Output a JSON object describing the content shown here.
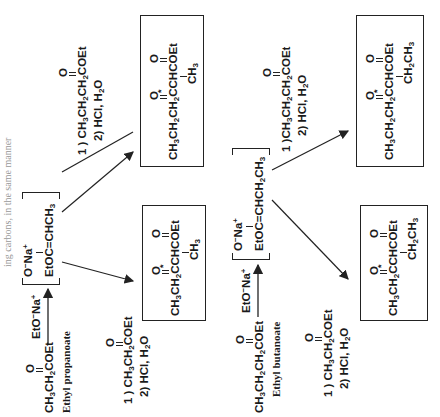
{
  "header_fragment": "ing carbons, in the same manner",
  "reactions": [
    {
      "name": "ethyl-propanoate-route",
      "reactant": {
        "formula": "CH3CH2COEt",
        "label": "Ethyl propanoate"
      },
      "base": "EtO⁻ Na⁺",
      "enolate": "EtOC=CHCH3 (O⁻ Na⁺)",
      "products": [
        {
          "reagents": [
            "1 ) CH3CH2COEt",
            "2) HCl, H2O"
          ],
          "product": "CH3CH2CCHCOEt with CH3 branch (* at ketone carbon)"
        },
        {
          "reagents": [
            "1 ) CH3CH2CH2COEt",
            "2) HCl, H2O"
          ],
          "product": "CH3CH2CH2CCHCOEt with CH3 branch (* at ketone carbon)"
        }
      ]
    },
    {
      "name": "ethyl-butanoate-route",
      "reactant": {
        "formula": "CH3CH2CH2COEt",
        "label": "Ethyl butanoate"
      },
      "base": "EtO⁻ Na⁺",
      "enolate": "EtOC=CHCH2CH3 (O⁻ Na⁺)",
      "products": [
        {
          "reagents": [
            "1 ) CH3CH2COEt",
            "2) HCl, H2O"
          ],
          "product": "CH3CH2CCHCOEt with CH2CH3 branch (* at ketone carbon)"
        },
        {
          "reagents": [
            "1 )CH3CH2CH2COEt",
            "2) HCl, H2O"
          ],
          "product": "CH3CH2CH2CCHCOEt with CH2CH3 branch (* at ketone carbon)"
        }
      ]
    }
  ],
  "text": {
    "r1_reactant": "CH3CH2COEt",
    "r1_label": "Ethyl propanoate",
    "r2_reactant": "CH3CH2CH2COEt",
    "r2_label": "Ethyl butanoate",
    "base": "EtO",
    "o_minus_na": "O",
    "enolate1": "EtOC=CHCH3",
    "enolate2": "EtOC=CHCH2CH3",
    "step2": "2) HCl, H2O",
    "reag_propanoate": "1 ) CH3CH2COEt",
    "reag_butanoate": "1 ) CH3CH2CH2COEt",
    "reag_butanoate_b": "1 )CH3CH2CH2COEt"
  }
}
